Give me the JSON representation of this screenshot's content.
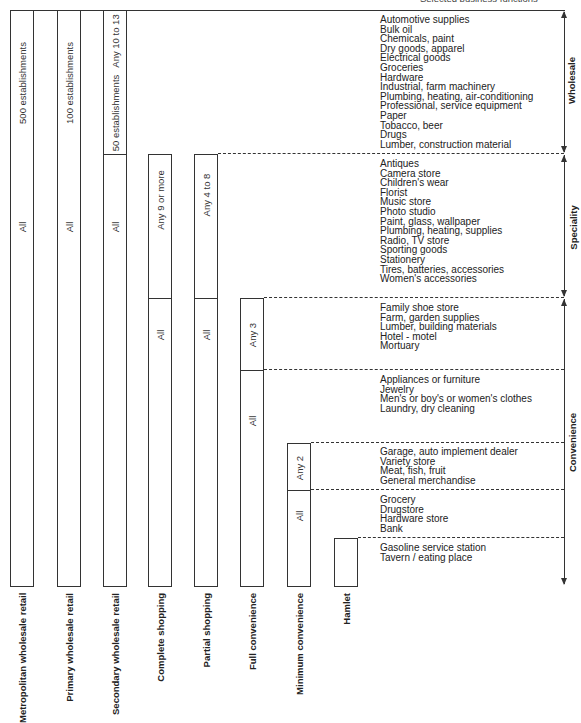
{
  "caption": "Selected business functions",
  "columns": [
    {
      "name": "Metropolitan wholesale retail",
      "segments": [
        "500 establishments",
        "All"
      ]
    },
    {
      "name": "Primary wholesale retail",
      "segments": [
        "100 establishments",
        "All"
      ]
    },
    {
      "name": "Secondary wholesale retail",
      "segments": [
        "Any 10 to 13",
        "50 establishments",
        "All"
      ]
    },
    {
      "name": "Complete shopping",
      "segments": [
        "Any 9 or more",
        "All"
      ]
    },
    {
      "name": "Partial shopping",
      "segments": [
        "Any 4 to 8",
        "All"
      ]
    },
    {
      "name": "Full convenience",
      "segments": [
        "Any 3",
        "All"
      ]
    },
    {
      "name": "Minimum convenience",
      "segments": [
        "Any 2",
        "All"
      ]
    },
    {
      "name": "Hamlet",
      "segments": []
    }
  ],
  "categories": {
    "wholesale": "Wholesale",
    "speciality": "Speciality",
    "convenience": "Convenience"
  },
  "groups": {
    "wholesale": [
      "Automotive supplies",
      "Bulk oil",
      "Chemicals, paint",
      "Dry goods, apparel",
      "Electrical goods",
      "Groceries",
      "Hardware",
      "Industrial, farm machinery",
      "Plumbing, heating, air-conditioning",
      "Professional, service equipment",
      "Paper",
      "Tobacco, beer",
      "Drugs",
      "Lumber, construction material"
    ],
    "speciality": [
      "Antiques",
      "Camera store",
      "Children's wear",
      "Florist",
      "Music store",
      "Photo studio",
      "Paint, glass, wallpaper",
      "Plumbing, heating, supplies",
      "Radio, TV store",
      "Sporting goods",
      "Stationery",
      "Tires, batteries, accessories",
      "Women's accessories"
    ],
    "full_convenience_any": [
      "Family shoe store",
      "Farm, garden supplies",
      "Lumber, building materials",
      "Hotel - motel",
      "Mortuary"
    ],
    "full_convenience_all": [
      "Appliances or furniture",
      "Jewelry",
      "Men's or boy's or women's clothes",
      "Laundry, dry cleaning"
    ],
    "minimum_convenience_any": [
      "Garage, auto implement dealer",
      "Variety store",
      "Meat, fish, fruit",
      "General merchandise"
    ],
    "minimum_convenience_all": [
      "Grocery",
      "Drugstore",
      "Hardware store",
      "Bank"
    ],
    "hamlet": [
      "Gasoline service station",
      "Tavern / eating place"
    ]
  }
}
